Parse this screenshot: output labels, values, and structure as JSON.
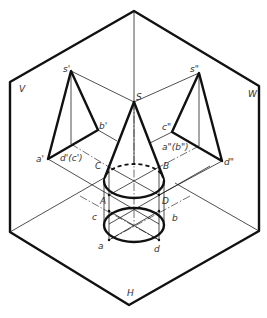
{
  "diagram": {
    "type": "three-plane orthographic projection of a cone (isometric view)",
    "planes": {
      "V": "V",
      "W": "W",
      "H": "H"
    },
    "labels": {
      "s_prime": "s'",
      "a_prime": "a'",
      "b_prime": "b'",
      "dc_prime": "d'(c')",
      "s_dprime": "s\"",
      "c_dprime": "c\"",
      "d_dprime": "d\"",
      "ab_dprime": "a\"(b\")",
      "S": "S",
      "A": "A",
      "B": "B",
      "C": "C",
      "D": "D",
      "a": "a",
      "b": "b",
      "c": "c",
      "d": "d"
    },
    "colors": {
      "line": "#111111",
      "label": "#333333",
      "background": "#ffffff"
    }
  }
}
